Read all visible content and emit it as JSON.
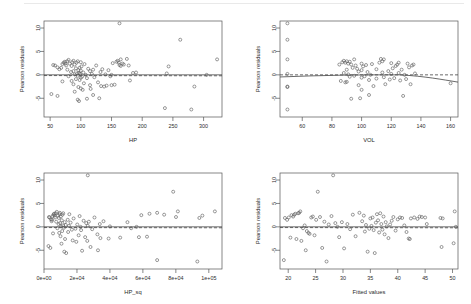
{
  "figure": {
    "type": "residual-diagnostic-grid",
    "rows": 2,
    "columns": 2,
    "background": "#ffffff",
    "point_color": "#555555",
    "line_color": "#444444",
    "frame_color": "#555555"
  },
  "chart_data": [
    {
      "type": "scatter",
      "title": "",
      "xlabel": "HP",
      "ylabel": "Pearson residuals",
      "xticks": [
        50,
        100,
        150,
        200,
        250,
        300
      ],
      "yticks": [
        10,
        5,
        0,
        -5
      ],
      "xlim": [
        40,
        330
      ],
      "ylim": [
        -9,
        11.5
      ],
      "grid": false,
      "legend": "none",
      "reference_line": {
        "style": "solid",
        "y": 0
      },
      "smoother_line": {
        "style": "dashed",
        "description": "near-flat lowess at y=0"
      },
      "x": [
        52,
        55,
        58,
        62,
        62,
        65,
        68,
        70,
        70,
        72,
        74,
        75,
        76,
        78,
        78,
        80,
        80,
        82,
        84,
        85,
        85,
        86,
        88,
        88,
        88,
        90,
        90,
        90,
        92,
        92,
        93,
        94,
        95,
        95,
        95,
        96,
        96,
        97,
        97,
        98,
        98,
        99,
        100,
        100,
        100,
        100,
        101,
        102,
        103,
        104,
        105,
        106,
        108,
        110,
        110,
        112,
        115,
        115,
        116,
        118,
        120,
        120,
        122,
        125,
        128,
        130,
        132,
        133,
        135,
        138,
        140,
        142,
        145,
        148,
        150,
        150,
        152,
        155,
        158,
        160,
        162,
        163,
        163,
        165,
        165,
        168,
        170,
        175,
        178,
        180,
        185,
        190,
        237,
        240,
        243,
        262,
        280,
        285,
        305,
        322
      ],
      "y": [
        -4.1,
        2.1,
        2.0,
        -4.5,
        1.6,
        1.2,
        1.5,
        2.3,
        -1.4,
        2.6,
        2.8,
        2.4,
        2.0,
        2.9,
        1.1,
        3.2,
        -0.3,
        2.4,
        0.6,
        1.9,
        -1.3,
        2.7,
        3.0,
        0.8,
        -2.0,
        2.2,
        0.1,
        -3.6,
        1.4,
        -0.9,
        2.6,
        0.3,
        2.9,
        -0.2,
        -5.3,
        1.0,
        -2.6,
        0.4,
        -5.6,
        1.5,
        -1.1,
        0.2,
        2.7,
        0.9,
        -0.6,
        -2.9,
        1.8,
        -0.4,
        -3.2,
        0.5,
        -1.8,
        2.3,
        0.0,
        -0.7,
        -5.1,
        1.3,
        -2.2,
        0.8,
        -3.0,
        0.2,
        1.1,
        -4.3,
        -0.5,
        2.0,
        -1.6,
        -5.0,
        0.6,
        -2.4,
        1.2,
        -2.5,
        0.1,
        -2.3,
        1.0,
        -0.3,
        0.0,
        -2.2,
        2.5,
        -2.1,
        2.8,
        3.0,
        2.6,
        11.0,
        2.1,
        3.3,
        1.9,
        2.4,
        2.2,
        3.4,
        2.0,
        -1.2,
        0.4,
        0.5,
        -7.1,
        0.3,
        1.8,
        7.5,
        -7.4,
        -2.5,
        0.0,
        3.3
      ]
    },
    {
      "type": "scatter",
      "title": "",
      "xlabel": "VOL",
      "ylabel": "Pearson residuals",
      "xticks": [
        60,
        80,
        100,
        120,
        140,
        160
      ],
      "yticks": [
        10,
        5,
        0,
        -5
      ],
      "xlim": [
        45,
        165
      ],
      "ylim": [
        -9,
        11.5
      ],
      "grid": false,
      "legend": "none",
      "reference_line": {
        "style": "dashed",
        "y": 0
      },
      "smoother_line": {
        "style": "solid",
        "description": "lowess, flat then dips below 0 after VOL 130"
      },
      "x": [
        50,
        50,
        50,
        50,
        50,
        50,
        50,
        85,
        86,
        87,
        88,
        88,
        89,
        89,
        90,
        90,
        90,
        91,
        91,
        92,
        92,
        93,
        93,
        94,
        95,
        95,
        96,
        97,
        98,
        98,
        99,
        100,
        100,
        100,
        100,
        101,
        102,
        103,
        104,
        105,
        105,
        106,
        107,
        108,
        110,
        110,
        112,
        113,
        114,
        114,
        115,
        115,
        116,
        118,
        119,
        120,
        120,
        121,
        122,
        123,
        124,
        125,
        125,
        126,
        127,
        128,
        129,
        130,
        131,
        132,
        133,
        134,
        135,
        136,
        160
      ],
      "y": [
        11.0,
        7.5,
        3.3,
        0.2,
        -2.5,
        -2.6,
        -7.4,
        2.2,
        -1.3,
        2.7,
        3.0,
        0.4,
        2.6,
        -1.6,
        2.9,
        1.1,
        -1.5,
        2.4,
        0.1,
        2.8,
        -0.4,
        2.2,
        -5.1,
        1.5,
        3.3,
        -0.2,
        2.0,
        1.3,
        0.7,
        -2.2,
        -5.0,
        2.4,
        1.0,
        -0.6,
        -3.2,
        1.8,
        -0.3,
        2.1,
        0.6,
        -1.1,
        -4.3,
        0.0,
        2.3,
        -2.4,
        1.2,
        -0.8,
        2.6,
        3.4,
        2.9,
        0.5,
        3.3,
        -0.5,
        -2.0,
        0.8,
        -1.0,
        2.5,
        0.2,
        1.4,
        -0.7,
        1.9,
        2.2,
        2.6,
        0.4,
        -1.2,
        1.1,
        -4.5,
        0.0,
        -0.9,
        2.4,
        1.6,
        -2.0,
        2.0,
        2.2,
        0.3,
        -1.8
      ]
    },
    {
      "type": "scatter",
      "title": "",
      "xlabel": "HP_sq",
      "ylabel": "Pearson residuals",
      "xticks": [
        "0e+00",
        "2e+04",
        "4e+04",
        "6e+04",
        "8e+04",
        "1e+05"
      ],
      "xtick_values": [
        0,
        20000,
        40000,
        60000,
        80000,
        100000
      ],
      "yticks": [
        10,
        5,
        0,
        -5
      ],
      "xlim": [
        0,
        108000
      ],
      "ylim": [
        -9,
        11.5
      ],
      "grid": false,
      "legend": "none",
      "reference_line": {
        "style": "solid",
        "y": 0
      },
      "smoother_line": {
        "style": "dashed",
        "description": "flat near 0 across range"
      },
      "x": [
        2704,
        3025,
        3364,
        3844,
        4225,
        4624,
        4900,
        5184,
        5476,
        5776,
        6084,
        6400,
        6724,
        7056,
        7396,
        7744,
        8100,
        8464,
        8836,
        9025,
        9216,
        9409,
        9604,
        9801,
        10000,
        10201,
        10404,
        10609,
        10816,
        11025,
        11236,
        11449,
        11664,
        12100,
        12321,
        12544,
        12769,
        13225,
        13456,
        14400,
        14641,
        15129,
        15376,
        16129,
        16900,
        17424,
        17956,
        19044,
        19600,
        20164,
        21025,
        21609,
        22201,
        22500,
        23104,
        24025,
        24964,
        25600,
        26244,
        26569,
        26569,
        27225,
        28224,
        29241,
        30625,
        32400,
        32761,
        33856,
        34225,
        36100,
        39204,
        40000,
        46225,
        50625,
        52900,
        56169,
        57600,
        59049,
        62500,
        64009,
        68644,
        68644,
        72900,
        78400,
        80089,
        81225,
        93025,
        94249,
        96100,
        103684
      ],
      "y": [
        -4.1,
        2.1,
        2.0,
        -4.5,
        1.6,
        1.2,
        1.5,
        2.3,
        -1.4,
        2.6,
        2.8,
        2.4,
        2.0,
        2.9,
        1.1,
        3.2,
        -0.3,
        2.4,
        0.6,
        1.9,
        -1.3,
        2.7,
        3.0,
        0.8,
        -2.0,
        2.2,
        0.1,
        -3.6,
        1.4,
        -0.9,
        2.6,
        0.3,
        2.9,
        -0.2,
        -5.3,
        1.0,
        -2.6,
        0.4,
        -5.6,
        1.5,
        -1.1,
        0.2,
        2.7,
        0.9,
        -0.6,
        -2.9,
        1.8,
        -0.4,
        -3.2,
        0.5,
        -1.8,
        2.3,
        0.0,
        -0.7,
        -5.1,
        1.3,
        -2.2,
        0.8,
        -3.0,
        11.0,
        0.2,
        1.1,
        -4.3,
        -0.5,
        2.0,
        -1.6,
        -5.0,
        0.6,
        -2.4,
        1.2,
        -2.5,
        0.1,
        -2.3,
        1.0,
        -0.3,
        0.0,
        -2.2,
        2.5,
        -2.1,
        2.8,
        3.0,
        -7.1,
        2.6,
        7.5,
        2.1,
        3.3,
        -7.4,
        1.9,
        2.4,
        3.3
      ]
    },
    {
      "type": "scatter",
      "title": "",
      "xlabel": "Fitted values",
      "ylabel": "Pearson residuals",
      "xticks": [
        20,
        25,
        30,
        35,
        40,
        45,
        50
      ],
      "yticks": [
        10,
        5,
        0,
        -5
      ],
      "xlim": [
        18.5,
        51
      ],
      "ylim": [
        -9,
        11.5
      ],
      "grid": false,
      "legend": "none",
      "reference_line": {
        "style": "solid",
        "y": 0
      },
      "smoother_line": {
        "style": "dashed",
        "description": "flat near 0"
      },
      "x": [
        19.2,
        19.4,
        19.8,
        20.1,
        20.4,
        20.6,
        20.9,
        21.1,
        21.3,
        21.5,
        21.8,
        22.0,
        22.2,
        22.4,
        22.7,
        23.0,
        23.2,
        23.4,
        23.7,
        23.9,
        24.2,
        24.5,
        24.8,
        25.1,
        25.4,
        25.8,
        26.2,
        26.6,
        27.0,
        27.4,
        27.9,
        28.2,
        28.6,
        29.0,
        29.3,
        29.8,
        30.2,
        30.8,
        31.3,
        31.8,
        32.3,
        33.0,
        33.5,
        33.8,
        34.0,
        34.2,
        34.5,
        34.8,
        35.0,
        35.2,
        35.4,
        35.6,
        35.8,
        36.0,
        36.2,
        36.4,
        36.6,
        36.8,
        37.0,
        37.2,
        37.4,
        37.6,
        37.8,
        38.0,
        38.3,
        38.6,
        38.9,
        39.2,
        39.6,
        40.0,
        40.4,
        40.8,
        41.2,
        41.6,
        42.0,
        42.2,
        42.4,
        43.0,
        43.6,
        44.0,
        44.4,
        45.0,
        45.3,
        47.8,
        48.0,
        48.2,
        50.2,
        50.4,
        50.6
      ],
      "y": [
        -7.1,
        1.9,
        1.5,
        2.0,
        -2.3,
        2.5,
        2.2,
        2.6,
        2.8,
        -2.6,
        2.9,
        3.0,
        3.3,
        -3.0,
        -0.3,
        0.3,
        -5.0,
        -0.9,
        -1.3,
        -1.5,
        2.0,
        2.2,
        -1.8,
        1.5,
        7.5,
        2.1,
        -4.5,
        1.1,
        -7.4,
        0.5,
        2.3,
        11.0,
        0.8,
        0.0,
        -2.2,
        1.0,
        -4.6,
        0.6,
        -0.5,
        2.6,
        -2.0,
        3.0,
        1.2,
        2.4,
        -1.0,
        0.4,
        -5.3,
        -0.4,
        1.8,
        0.2,
        2.0,
        -0.7,
        -5.6,
        0.9,
        2.7,
        1.4,
        -1.2,
        2.9,
        0.6,
        -0.6,
        2.2,
        -1.6,
        1.0,
        0.1,
        -2.4,
        0.5,
        1.3,
        2.1,
        -0.8,
        1.6,
        2.0,
        1.9,
        0.3,
        -1.1,
        -2.5,
        -2.6,
        1.8,
        2.0,
        1.7,
        2.2,
        2.1,
        2.0,
        0.6,
        1.9,
        -4.3,
        1.8,
        -3.5,
        3.3,
        0.0
      ]
    }
  ],
  "panels": [
    {
      "name": "panel-hp",
      "xlabel": "HP",
      "ylabel": "Pearson residuals"
    },
    {
      "name": "panel-vol",
      "xlabel": "VOL",
      "ylabel": "Pearson residuals"
    },
    {
      "name": "panel-hpsq",
      "xlabel": "HP_sq",
      "ylabel": "Pearson residuals"
    },
    {
      "name": "panel-fitted",
      "xlabel": "Fitted values",
      "ylabel": "Pearson residuals"
    }
  ]
}
